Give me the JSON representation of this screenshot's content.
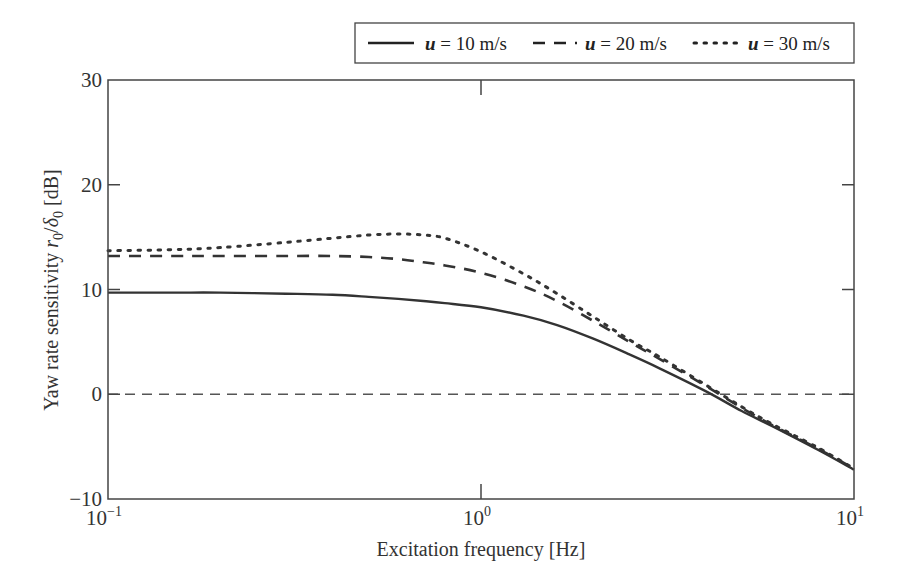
{
  "chart_data": {
    "type": "line",
    "title": "",
    "xlabel": "Excitation frequency [Hz]",
    "ylabel": "Yaw rate sensitivity r0/δ0 [dB]",
    "ylabel_parts": {
      "prefix": "Yaw rate sensitivity ",
      "r": "r",
      "r_sub": "0",
      "slash": "/",
      "d": "δ",
      "d_sub": "0",
      "suffix": " [dB]"
    },
    "xscale": "log",
    "xlim": [
      0.1,
      10
    ],
    "ylim": [
      -10,
      30
    ],
    "grid": false,
    "x_ticks": [
      {
        "value": 0.1,
        "base": "10",
        "exp": "−1"
      },
      {
        "value": 1,
        "base": "10",
        "exp": "0"
      },
      {
        "value": 10,
        "base": "10",
        "exp": "1"
      }
    ],
    "y_ticks": [
      {
        "value": -10,
        "label": "−10"
      },
      {
        "value": 0,
        "label": "0"
      },
      {
        "value": 10,
        "label": "10"
      },
      {
        "value": 20,
        "label": "20"
      },
      {
        "value": 30,
        "label": "30"
      }
    ],
    "reference_line": {
      "y": 0,
      "style": "dashed"
    },
    "legend": {
      "position": "top-right, above plot",
      "entries": [
        {
          "var": "u",
          "text": " = 10 m/s",
          "style": "solid"
        },
        {
          "var": "u",
          "text": " = 20 m/s",
          "style": "dashed"
        },
        {
          "var": "u",
          "text": " = 30 m/s",
          "style": "dotted"
        }
      ]
    },
    "x": [
      0.1,
      0.15,
      0.2,
      0.3,
      0.4,
      0.5,
      0.6,
      0.7,
      0.8,
      1.0,
      1.3,
      1.6,
      2.0,
      2.5,
      3.0,
      4.0,
      5.0,
      6.0,
      8.0,
      10.0
    ],
    "series": [
      {
        "name": "u = 10 m/s",
        "style": "solid",
        "values": [
          9.7,
          9.7,
          9.7,
          9.6,
          9.5,
          9.3,
          9.1,
          8.9,
          8.7,
          8.3,
          7.5,
          6.6,
          5.3,
          3.8,
          2.5,
          0.3,
          -1.6,
          -3.0,
          -5.3,
          -7.2
        ]
      },
      {
        "name": "u = 20 m/s",
        "style": "dashed",
        "values": [
          13.2,
          13.2,
          13.2,
          13.2,
          13.2,
          13.1,
          12.9,
          12.6,
          12.3,
          11.6,
          10.3,
          8.9,
          7.0,
          5.0,
          3.4,
          0.8,
          -1.3,
          -2.9,
          -5.2,
          -7.1
        ]
      },
      {
        "name": "u = 30 m/s",
        "style": "dotted",
        "values": [
          13.7,
          13.8,
          14.0,
          14.5,
          14.9,
          15.2,
          15.3,
          15.2,
          14.9,
          13.6,
          11.5,
          9.6,
          7.4,
          5.2,
          3.6,
          0.9,
          -1.2,
          -2.8,
          -5.1,
          -7.1
        ]
      }
    ]
  }
}
